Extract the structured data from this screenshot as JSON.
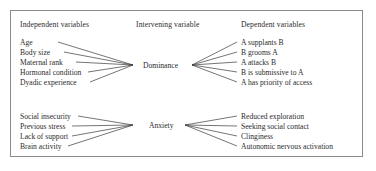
{
  "figure": {
    "type": "conceptual-flow-diagram",
    "border_color": "#8a8a8a",
    "line_color": "#3a3a3a",
    "text_color": "#2b2b2b",
    "background": "#ffffff"
  },
  "headers": {
    "independent": "Independent variables",
    "intervening": "Intervening variable",
    "dependent": "Dependent variables"
  },
  "groups": [
    {
      "node": "Dominance",
      "independent": [
        "Age",
        "Body size",
        "Maternal rank",
        "Hormonal condition",
        "Dyadic experience"
      ],
      "dependent": [
        "A supplants B",
        "B grooms A",
        "A attacks B",
        "B is submissive to A",
        "A has priority of access"
      ]
    },
    {
      "node": "Anxiety",
      "independent": [
        "Social insecurity",
        "Previous stress",
        "Lack of support",
        "Brain activity"
      ],
      "dependent": [
        "Reduced exploration",
        "Seeking social contact",
        "Clinginess",
        "Autonomic nervous activation"
      ]
    }
  ]
}
